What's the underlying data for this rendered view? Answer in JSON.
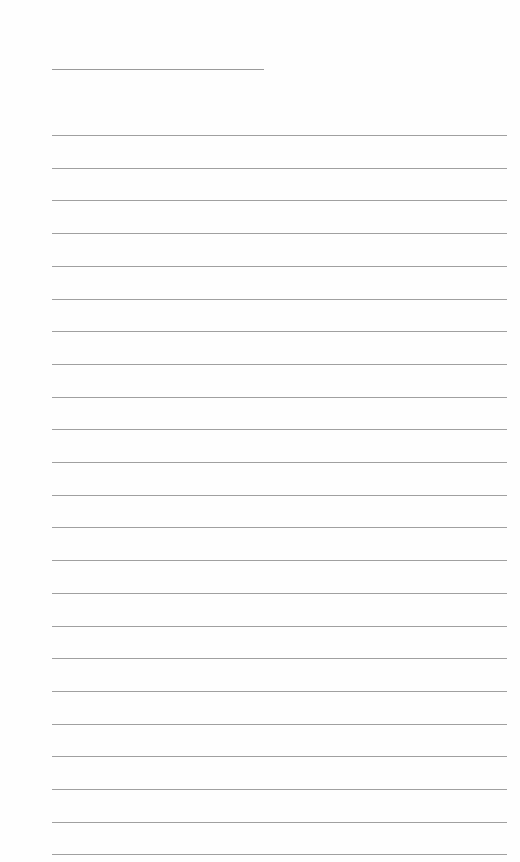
{
  "page": {
    "type": "lined-paper",
    "title": "",
    "title_line": {
      "x": 52,
      "y": 69,
      "width": 212
    },
    "rules": {
      "count": 23,
      "x": 52,
      "width": 455,
      "first_y": 135,
      "spacing": 32.7,
      "color": "#a0a0a0"
    },
    "lines_text": []
  }
}
